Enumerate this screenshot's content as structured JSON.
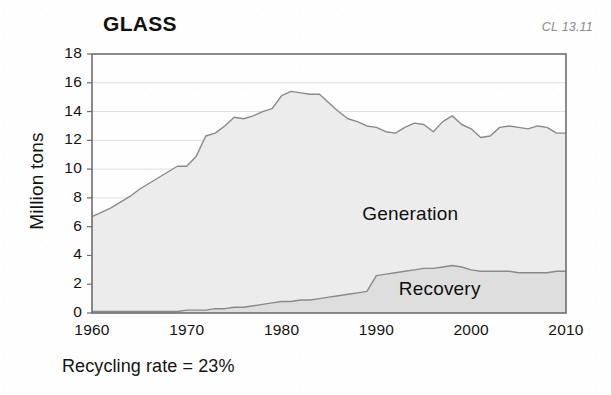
{
  "figure": {
    "title": "GLASS",
    "code": "CL 13.11",
    "caption": "Recycling rate = 23%"
  },
  "chart_data": {
    "type": "area",
    "title": "GLASS",
    "xlabel": "",
    "ylabel": "Million tons",
    "xlim": [
      1960,
      2010
    ],
    "ylim": [
      0,
      18
    ],
    "xticks": [
      1960,
      1970,
      1980,
      1990,
      2000,
      2010
    ],
    "yticks": [
      0,
      2,
      4,
      6,
      8,
      10,
      12,
      14,
      16,
      18
    ],
    "grid": true,
    "stacked": true,
    "legend": "inline-annotation",
    "annotations": [
      {
        "text": "Generation",
        "x": 1994,
        "y": 6.8
      },
      {
        "text": "Recovery",
        "x": 1997,
        "y": 1.6
      }
    ],
    "x": [
      1960,
      1961,
      1962,
      1963,
      1964,
      1965,
      1966,
      1967,
      1968,
      1969,
      1970,
      1971,
      1972,
      1973,
      1974,
      1975,
      1976,
      1977,
      1978,
      1979,
      1980,
      1981,
      1982,
      1983,
      1984,
      1985,
      1986,
      1987,
      1988,
      1989,
      1990,
      1991,
      1992,
      1993,
      1994,
      1995,
      1996,
      1997,
      1998,
      1999,
      2000,
      2001,
      2002,
      2003,
      2004,
      2005,
      2006,
      2007,
      2008,
      2009,
      2010
    ],
    "series": [
      {
        "name": "Generation",
        "values": [
          6.7,
          7.0,
          7.3,
          7.7,
          8.1,
          8.6,
          9.0,
          9.4,
          9.8,
          10.2,
          10.2,
          10.9,
          12.3,
          12.5,
          13.0,
          13.6,
          13.5,
          13.7,
          14.0,
          14.2,
          15.1,
          15.4,
          15.3,
          15.2,
          15.2,
          14.6,
          14.0,
          13.5,
          13.3,
          13.0,
          12.9,
          12.6,
          12.5,
          12.9,
          13.2,
          13.1,
          12.6,
          13.3,
          13.7,
          13.1,
          12.8,
          12.2,
          12.3,
          12.9,
          13.0,
          12.9,
          12.8,
          13.0,
          12.9,
          12.5,
          12.5
        ]
      },
      {
        "name": "Recovery",
        "values": [
          0.1,
          0.1,
          0.1,
          0.1,
          0.1,
          0.1,
          0.1,
          0.1,
          0.1,
          0.1,
          0.2,
          0.2,
          0.2,
          0.3,
          0.3,
          0.4,
          0.4,
          0.5,
          0.6,
          0.7,
          0.8,
          0.8,
          0.9,
          0.9,
          1.0,
          1.1,
          1.2,
          1.3,
          1.4,
          1.5,
          2.6,
          2.7,
          2.8,
          2.9,
          3.0,
          3.1,
          3.1,
          3.2,
          3.3,
          3.2,
          3.0,
          2.9,
          2.9,
          2.9,
          2.9,
          2.8,
          2.8,
          2.8,
          2.8,
          2.9,
          2.9
        ]
      }
    ]
  },
  "axis": {
    "yticks": [
      "18",
      "16",
      "14",
      "12",
      "10",
      "8",
      "6",
      "4",
      "2",
      "0"
    ],
    "xticks": [
      "1960",
      "1970",
      "1980",
      "1990",
      "2000",
      "2010"
    ],
    "ylabel": "Million tons"
  },
  "labels": {
    "generation": "Generation",
    "recovery": "Recovery"
  },
  "colors": {
    "generation_fill": "#ececec",
    "recovery_fill": "#dedede",
    "line": "#8a8a8a",
    "frame": "#6e6e6e",
    "grid": "#dfdfdf",
    "text": "#131313",
    "code": "#8c8c8c"
  }
}
